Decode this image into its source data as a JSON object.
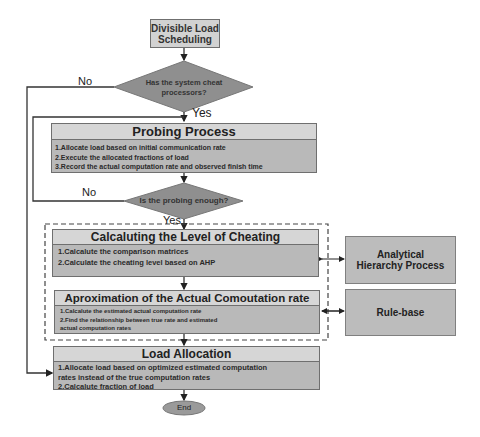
{
  "start": {
    "line1": "Divisible Load",
    "line2": "Scheduling"
  },
  "decision1": {
    "line1": "Has the system cheat",
    "line2": "processors?",
    "yes": "Yes",
    "no": "No"
  },
  "probing": {
    "title": "Probing Process",
    "items": [
      "1.Allocate load based on initial communication rate",
      "2.Execute  the allocated fractions of load",
      "3.Record the actual  computation  rate and observed finish time"
    ]
  },
  "decision2": {
    "text": "Is the probing enough?",
    "yes": "Yes",
    "no": "No"
  },
  "cheating": {
    "title": "Calcaluting the Level of Cheating",
    "items": [
      "1.Calcalute the comparison matrices",
      "2.Calculate the cheating level based on AHP"
    ]
  },
  "approx": {
    "title": "Aproximation of  the Actual Comoutation rate",
    "items": [
      "1.Calcalute the estimated actual computation rate",
      "2.Find the relationship between true rate and estimated",
      "actual  computation rates"
    ]
  },
  "allocation": {
    "title": "Load Allocation",
    "items": [
      "1.Allocate load based on optimized estimated computation",
      "rates instead of the true computation rates",
      "2.Calcalute fraction of load"
    ]
  },
  "end": {
    "label": "End"
  },
  "ahp": {
    "line1": "Analytical",
    "line2": "Hierarchy Process"
  },
  "rulebase": {
    "label": "Rule-base"
  }
}
